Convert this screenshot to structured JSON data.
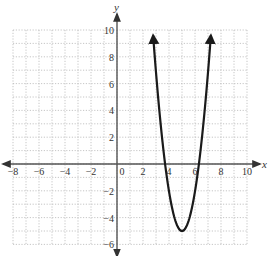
{
  "chart_data": {
    "type": "line",
    "title": "",
    "xlabel": "x",
    "ylabel": "y",
    "xlim": [
      -8,
      10
    ],
    "ylim": [
      -6,
      10
    ],
    "grid": true,
    "grid_step": 1,
    "x_ticks": [
      -8,
      -6,
      -4,
      -2,
      0,
      2,
      4,
      6,
      8,
      10
    ],
    "y_ticks": [
      -6,
      -4,
      -2,
      2,
      4,
      6,
      8,
      10
    ],
    "x_tick_labels": [
      "−8",
      "−6",
      "−4",
      "−2",
      "0",
      "2",
      "4",
      "6",
      "8",
      "10"
    ],
    "y_tick_labels": [
      "−6",
      "−4",
      "−2",
      "2",
      "4",
      "6",
      "8",
      "10"
    ],
    "series": [
      {
        "name": "parabola",
        "description": "Upward-opening parabola with vertex near (5, -5) and x-intercepts near 3.7 and 6.3; arrows at both ends",
        "vertex": [
          5,
          -5
        ],
        "x_intercepts": [
          3.7,
          6.3
        ],
        "x": [
          2.8,
          3.0,
          3.5,
          3.7,
          4.0,
          4.5,
          5.0,
          5.5,
          6.0,
          6.3,
          6.5,
          7.0,
          7.2
        ],
        "y": [
          9.5,
          7.0,
          1.75,
          0.0,
          -2.0,
          -4.25,
          -5.0,
          -4.25,
          -2.0,
          0.0,
          1.75,
          7.0,
          9.5
        ]
      }
    ]
  },
  "labels": {
    "x_axis": "x",
    "y_axis": "y"
  },
  "colors": {
    "curve": "#1a1a1a",
    "axis": "#555555",
    "grid": "#b8b8b8",
    "background": "#ffffff"
  }
}
